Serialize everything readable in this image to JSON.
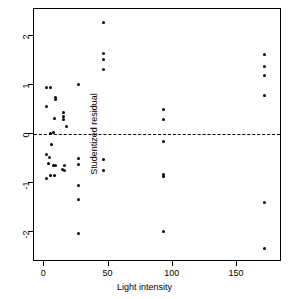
{
  "chart_data": {
    "type": "scatter",
    "title": "",
    "xlabel": "Light intensity",
    "ylabel": "Studentized residual",
    "xlim": [
      -8,
      185
    ],
    "ylim": [
      -2.62,
      2.55
    ],
    "grid": false,
    "legend": null,
    "xticks": [
      0,
      50,
      100,
      150
    ],
    "xticklabels": [
      "0",
      "50",
      "100",
      "150"
    ],
    "yticks": [
      -2,
      -1,
      0,
      1,
      2
    ],
    "yticklabels": [
      "-2",
      "-1",
      "0",
      "1",
      "2"
    ],
    "annotations": [
      {
        "type": "hline",
        "y": 0,
        "style": "dashed",
        "color": "#000000"
      }
    ],
    "series": [
      {
        "name": "studentized residuals",
        "marker": "circle",
        "color": "#000000",
        "points": [
          {
            "x": 2,
            "y": 0.94
          },
          {
            "x": 5,
            "y": 0.94
          },
          {
            "x": 2,
            "y": 0.55
          },
          {
            "x": 9,
            "y": 0.75
          },
          {
            "x": 9,
            "y": 0.71
          },
          {
            "x": 8,
            "y": 0.31
          },
          {
            "x": 15,
            "y": 0.44
          },
          {
            "x": 15,
            "y": 0.36
          },
          {
            "x": 15,
            "y": 0.3
          },
          {
            "x": 17,
            "y": 0.15
          },
          {
            "x": 7,
            "y": 0.02
          },
          {
            "x": 5,
            "y": 0.0
          },
          {
            "x": 6,
            "y": -0.22
          },
          {
            "x": 2,
            "y": -0.42
          },
          {
            "x": 4,
            "y": -0.48
          },
          {
            "x": 3,
            "y": -0.6
          },
          {
            "x": 7,
            "y": -0.65
          },
          {
            "x": 9,
            "y": -0.64
          },
          {
            "x": 2,
            "y": -0.91
          },
          {
            "x": 5,
            "y": -0.85
          },
          {
            "x": 8,
            "y": -0.85
          },
          {
            "x": 14,
            "y": -0.73
          },
          {
            "x": 16,
            "y": -0.65
          },
          {
            "x": 16,
            "y": -0.75
          },
          {
            "x": 27,
            "y": 1.01
          },
          {
            "x": 27,
            "y": -0.51
          },
          {
            "x": 27,
            "y": -0.63
          },
          {
            "x": 27,
            "y": -1.06
          },
          {
            "x": 27,
            "y": -1.34
          },
          {
            "x": 27,
            "y": -2.04
          },
          {
            "x": 46,
            "y": 2.27
          },
          {
            "x": 46,
            "y": 1.65
          },
          {
            "x": 46,
            "y": 1.52
          },
          {
            "x": 46,
            "y": 1.32
          },
          {
            "x": 46,
            "y": -0.52
          },
          {
            "x": 46,
            "y": -0.74
          },
          {
            "x": 93,
            "y": 0.5
          },
          {
            "x": 93,
            "y": 0.29
          },
          {
            "x": 93,
            "y": -0.15
          },
          {
            "x": 93,
            "y": -0.83
          },
          {
            "x": 93,
            "y": -0.88
          },
          {
            "x": 93,
            "y": -2.0
          },
          {
            "x": 171,
            "y": 1.63
          },
          {
            "x": 171,
            "y": 1.37
          },
          {
            "x": 171,
            "y": 1.2
          },
          {
            "x": 171,
            "y": 0.79
          },
          {
            "x": 171,
            "y": -1.4
          },
          {
            "x": 171,
            "y": -2.35
          }
        ]
      }
    ]
  }
}
